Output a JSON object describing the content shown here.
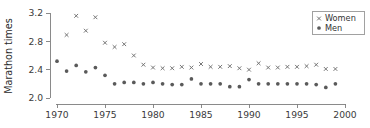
{
  "chart_data": {
    "type": "scatter",
    "title": "",
    "xlabel": "",
    "ylabel": "Marathon times",
    "xlim": [
      1969,
      2000.5
    ],
    "ylim": [
      2.0,
      3.22
    ],
    "grid": false,
    "legend_position": "top-right",
    "xticks": [
      1970,
      1975,
      1980,
      1985,
      1990,
      1995,
      2000
    ],
    "xtick_labels": [
      "1970",
      "1975",
      "1980",
      "1985",
      "1990",
      "1995",
      "2000"
    ],
    "yticks": [
      2.0,
      2.4,
      2.8,
      3.2
    ],
    "ytick_labels": [
      "2.0",
      "2.4",
      "2.8",
      "3.2"
    ],
    "series": [
      {
        "name": "Women",
        "marker": "x",
        "color": "#6f6f6f",
        "x": [
          1971,
          1972,
          1973,
          1974,
          1975,
          1976,
          1977,
          1978,
          1979,
          1980,
          1981,
          1982,
          1983,
          1984,
          1985,
          1986,
          1987,
          1988,
          1989,
          1990,
          1991,
          1992,
          1993,
          1994,
          1995,
          1996,
          1997,
          1998,
          1999
        ],
        "y": [
          2.89,
          3.16,
          2.95,
          3.14,
          2.78,
          2.72,
          2.76,
          2.6,
          2.47,
          2.43,
          2.42,
          2.42,
          2.44,
          2.43,
          2.48,
          2.44,
          2.44,
          2.45,
          2.42,
          2.4,
          2.49,
          2.43,
          2.43,
          2.44,
          2.44,
          2.45,
          2.47,
          2.41,
          2.41
        ]
      },
      {
        "name": "Men",
        "marker": "o",
        "color": "#5a5a5a",
        "x": [
          1970,
          1971,
          1972,
          1973,
          1974,
          1975,
          1976,
          1977,
          1978,
          1979,
          1980,
          1981,
          1982,
          1983,
          1984,
          1985,
          1986,
          1987,
          1988,
          1989,
          1990,
          1991,
          1992,
          1993,
          1994,
          1995,
          1996,
          1997,
          1998,
          1999
        ],
        "y": [
          2.52,
          2.38,
          2.46,
          2.37,
          2.43,
          2.32,
          2.2,
          2.22,
          2.22,
          2.2,
          2.22,
          2.2,
          2.19,
          2.19,
          2.27,
          2.2,
          2.2,
          2.2,
          2.16,
          2.16,
          2.26,
          2.2,
          2.2,
          2.2,
          2.2,
          2.2,
          2.2,
          2.19,
          2.15,
          2.2
        ]
      }
    ]
  },
  "legend": {
    "entries": [
      {
        "label": "Women",
        "marker": "x"
      },
      {
        "label": "Men",
        "marker": "o"
      }
    ]
  }
}
